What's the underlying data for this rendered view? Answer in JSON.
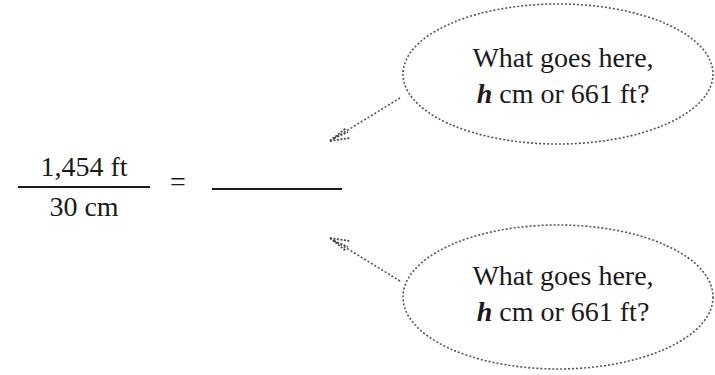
{
  "equation": {
    "numerator": "1,454 ft",
    "denominator": "30 cm",
    "equals_sign": "=",
    "blank": ""
  },
  "callouts": [
    {
      "line1": "What goes here,",
      "var": "h",
      "line2_rest": " cm or 661 ft?",
      "points_to": "numerator of right side"
    },
    {
      "line1": "What goes here,",
      "var": "h",
      "line2_rest": " cm or 661 ft?",
      "points_to": "denominator of right side"
    }
  ],
  "colors": {
    "ink": "#1a1a1a",
    "bubble_outline": "#555555",
    "background": "#ffffff"
  }
}
